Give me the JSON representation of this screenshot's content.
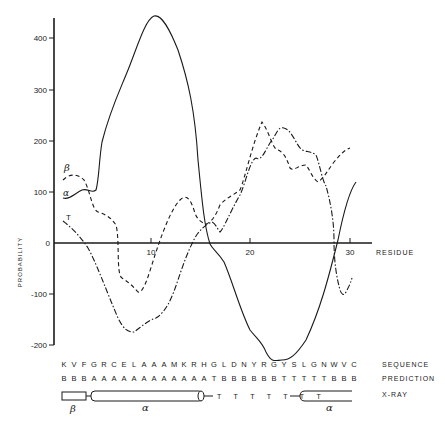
{
  "chart_data": {
    "type": "line",
    "title": "",
    "xlabel": "RESIDUE",
    "ylabel": "PROBABILITY",
    "xlim": [
      0,
      32
    ],
    "ylim": [
      -200,
      420
    ],
    "x_ticks": [
      "10",
      "20",
      "30"
    ],
    "y_ticks": [
      "400",
      "300",
      "200",
      "100",
      "0",
      "-100",
      "-200"
    ],
    "grid": false,
    "legend_position": "inline-left",
    "series": [
      {
        "name": "α",
        "style": "solid",
        "x": [
          1,
          2,
          3,
          4,
          5,
          6,
          7,
          8,
          9,
          10,
          11,
          12,
          13,
          14,
          15,
          16,
          17,
          18,
          19,
          20,
          21,
          22,
          23,
          24,
          25,
          26,
          27,
          28,
          29,
          30
        ],
        "values": [
          88,
          95,
          110,
          200,
          290,
          350,
          395,
          430,
          445,
          440,
          410,
          340,
          200,
          30,
          -20,
          -60,
          -100,
          -140,
          -165,
          -175,
          -180,
          -175,
          -170,
          -150,
          -110,
          -60,
          0,
          70,
          140,
          175
        ]
      },
      {
        "name": "β",
        "style": "dashed",
        "x": [
          1,
          2,
          3,
          4,
          5,
          6,
          7,
          8,
          9,
          10,
          11,
          12,
          13,
          14,
          15,
          16,
          17,
          18,
          19,
          20,
          21,
          22,
          23,
          24,
          25,
          26,
          27,
          28,
          29,
          30
        ],
        "values": [
          120,
          125,
          80,
          60,
          0,
          -80,
          -90,
          -100,
          -60,
          10,
          60,
          90,
          60,
          20,
          50,
          80,
          110,
          130,
          170,
          235,
          200,
          180,
          140,
          170,
          140,
          110,
          120,
          140,
          160,
          185
        ]
      },
      {
        "name": "T",
        "style": "dash-dot",
        "x": [
          1,
          2,
          3,
          4,
          5,
          6,
          7,
          8,
          9,
          10,
          11,
          12,
          13,
          14,
          15,
          16,
          17,
          18,
          19,
          20,
          21,
          22,
          23,
          24,
          25,
          26,
          27,
          28,
          29,
          30
        ],
        "values": [
          35,
          20,
          -20,
          -90,
          -150,
          -175,
          -160,
          -150,
          -120,
          -60,
          0,
          40,
          50,
          35,
          60,
          90,
          120,
          165,
          160,
          200,
          220,
          230,
          200,
          170,
          160,
          110,
          -100,
          -180,
          -100,
          -60
        ]
      }
    ],
    "annotations": {
      "sequence_label": "SEQUENCE",
      "prediction_label": "PREDICTION",
      "xray_label": "X-RAY",
      "sequence": [
        "K",
        "V",
        "F",
        "G",
        "R",
        "C",
        "E",
        "L",
        "A",
        "A",
        "A",
        "M",
        "K",
        "R",
        "H",
        "G",
        "L",
        "D",
        "N",
        "Y",
        "R",
        "G",
        "Y",
        "S",
        "L",
        "G",
        "N",
        "W",
        "V",
        "C"
      ],
      "prediction": [
        "B",
        "B",
        "B",
        "A",
        "A",
        "A",
        "A",
        "A",
        "A",
        "A",
        "A",
        "A",
        "A",
        "A",
        "A",
        "T",
        "B",
        "B",
        "B",
        "B",
        "B",
        "B",
        "T",
        "T",
        "T",
        "T",
        "T",
        "B",
        "B",
        "B"
      ],
      "xray_turns": "T T T T T T T",
      "xray_segments": [
        {
          "type": "β",
          "label": "β"
        },
        {
          "type": "α",
          "label": "α"
        },
        {
          "type": "α",
          "label": "α"
        }
      ]
    }
  }
}
